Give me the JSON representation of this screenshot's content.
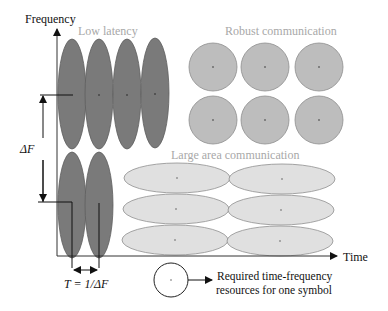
{
  "axes": {
    "y_label": "Frequency",
    "x_label": "Time"
  },
  "regions": {
    "low_latency": {
      "label": "Low latency",
      "fill": "#7a7a7a",
      "stroke": "#5a5a5a"
    },
    "robust": {
      "label": "Robust communication",
      "fill": "#bdbdbd",
      "stroke": "#8a8a8a"
    },
    "large_area": {
      "label": "Large area communication",
      "fill": "#e0e0e0",
      "stroke": "#8a8a8a"
    }
  },
  "annotations": {
    "delta_f": "ΔF",
    "t_symbol": "T = 1/ΔF"
  },
  "legend": {
    "line1": "Required time-frequency",
    "line2": "resources for one symbol"
  },
  "colors": {
    "label_gray": "#a8a8a8",
    "text_black": "#111111",
    "axis": "#222222"
  }
}
